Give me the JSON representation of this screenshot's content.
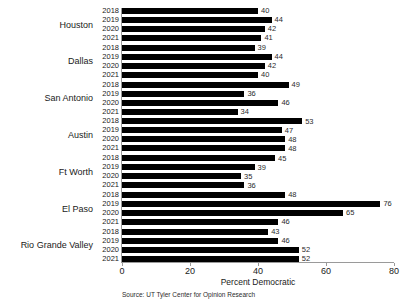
{
  "chart_data": {
    "type": "bar",
    "orientation": "horizontal",
    "title": "",
    "xlabel": "Percent Democratic",
    "ylabel": "",
    "xlim": [
      0,
      80
    ],
    "xticks": [
      0,
      20,
      40,
      60,
      80
    ],
    "grid": false,
    "legend": false,
    "bar_color": "#000000",
    "axis_color": "#9a9a9a",
    "background": "#ffffff",
    "source": "Source: UT Tyler Center for Opinion Research",
    "years": [
      "2018",
      "2019",
      "2020",
      "2021"
    ],
    "categories": [
      "Houston",
      "Dallas",
      "San Antonio",
      "Austin",
      "Ft Worth",
      "El Paso",
      "Rio Grande Valley"
    ],
    "series": [
      {
        "name": "2018",
        "values": [
          40,
          39,
          49,
          53,
          45,
          48,
          43
        ]
      },
      {
        "name": "2019",
        "values": [
          44,
          44,
          36,
          47,
          39,
          76,
          46
        ]
      },
      {
        "name": "2020",
        "values": [
          42,
          42,
          46,
          48,
          35,
          65,
          52
        ]
      },
      {
        "name": "2021",
        "values": [
          41,
          40,
          34,
          48,
          36,
          46,
          52
        ]
      }
    ],
    "groups": [
      {
        "category": "Houston",
        "bars": [
          {
            "year": "2018",
            "value": 40
          },
          {
            "year": "2019",
            "value": 44
          },
          {
            "year": "2020",
            "value": 42
          },
          {
            "year": "2021",
            "value": 41
          }
        ]
      },
      {
        "category": "Dallas",
        "bars": [
          {
            "year": "2018",
            "value": 39
          },
          {
            "year": "2019",
            "value": 44
          },
          {
            "year": "2020",
            "value": 42
          },
          {
            "year": "2021",
            "value": 40
          }
        ]
      },
      {
        "category": "San Antonio",
        "bars": [
          {
            "year": "2018",
            "value": 49
          },
          {
            "year": "2019",
            "value": 36
          },
          {
            "year": "2020",
            "value": 46
          },
          {
            "year": "2021",
            "value": 34
          }
        ]
      },
      {
        "category": "Austin",
        "bars": [
          {
            "year": "2018",
            "value": 53
          },
          {
            "year": "2019",
            "value": 47
          },
          {
            "year": "2020",
            "value": 48
          },
          {
            "year": "2021",
            "value": 48
          }
        ]
      },
      {
        "category": "Ft Worth",
        "bars": [
          {
            "year": "2018",
            "value": 45
          },
          {
            "year": "2019",
            "value": 39
          },
          {
            "year": "2020",
            "value": 35
          },
          {
            "year": "2021",
            "value": 36
          }
        ]
      },
      {
        "category": "El Paso",
        "bars": [
          {
            "year": "2018",
            "value": 48
          },
          {
            "year": "2019",
            "value": 76
          },
          {
            "year": "2020",
            "value": 65
          },
          {
            "year": "2021",
            "value": 46
          }
        ]
      },
      {
        "category": "Rio Grande Valley",
        "bars": [
          {
            "year": "2018",
            "value": 43
          },
          {
            "year": "2019",
            "value": 46
          },
          {
            "year": "2020",
            "value": 52
          },
          {
            "year": "2021",
            "value": 52
          }
        ]
      }
    ]
  }
}
